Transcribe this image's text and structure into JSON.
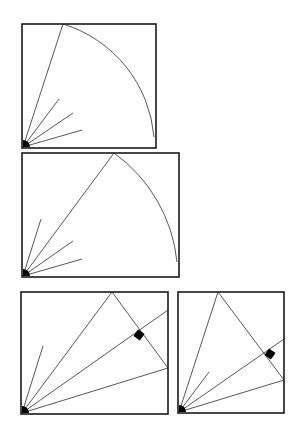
{
  "diagram": {
    "colors": {
      "frame": "#1a1a1a",
      "line": "#444444",
      "fill": "#000000",
      "background": "#ffffff"
    },
    "panels": [
      {
        "id": "panel-1",
        "box": {
          "x": 22,
          "y": 24,
          "w": 134,
          "h": 124
        },
        "origin": [
          23,
          147
        ],
        "long_rays": [
          [
            63,
            24
          ]
        ],
        "short_rays": [
          [
            59,
            99
          ],
          [
            73,
            113
          ],
          [
            82,
            130
          ]
        ],
        "arc": {
          "from": [
            63,
            24
          ],
          "to": [
            154,
            137
          ]
        },
        "right_angle_marker": null
      },
      {
        "id": "panel-2",
        "box": {
          "x": 22,
          "y": 153,
          "w": 157,
          "h": 124
        },
        "origin": [
          23,
          276
        ],
        "long_rays": [
          [
            114,
            153
          ]
        ],
        "short_rays": [
          [
            41,
            219
          ],
          [
            73,
            241
          ],
          [
            82,
            259
          ]
        ],
        "arc": {
          "from": [
            114,
            153
          ],
          "to": [
            177,
            262
          ]
        },
        "right_angle_marker": null
      },
      {
        "id": "panel-3",
        "box": {
          "x": 21,
          "y": 292,
          "w": 147,
          "h": 122
        },
        "origin": [
          22,
          413
        ],
        "long_rays": [
          [
            112,
            292
          ],
          [
            168,
            310
          ],
          [
            168,
            368
          ]
        ],
        "short_rays": [
          [
            43,
            346
          ]
        ],
        "segments": [
          [
            [
              112,
              292
            ],
            [
              168,
              368
            ]
          ]
        ],
        "right_angle_marker": {
          "x": 139,
          "y": 335
        }
      },
      {
        "id": "panel-4",
        "box": {
          "x": 178,
          "y": 292,
          "w": 106,
          "h": 121
        },
        "origin": [
          179,
          412
        ],
        "long_rays": [
          [
            218,
            292
          ],
          [
            284,
            339
          ],
          [
            284,
            380
          ]
        ],
        "short_rays": [
          [
            209,
            372
          ]
        ],
        "segments": [
          [
            [
              218,
              292
            ],
            [
              284,
              380
            ]
          ]
        ],
        "right_angle_marker": {
          "x": 270,
          "y": 354
        }
      }
    ]
  }
}
